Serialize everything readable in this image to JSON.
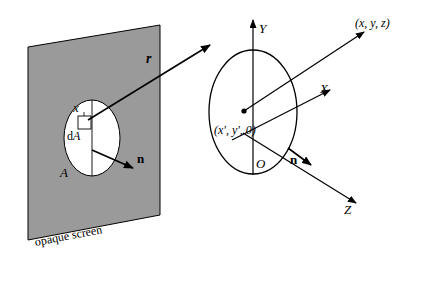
{
  "figure": {
    "colors": {
      "screen_fill": "#9a9a9a",
      "aperture_fill": "#ffffff",
      "stroke": "#000000",
      "background": "#ffffff"
    },
    "left_panel": {
      "screen_label": "opaque screen",
      "aperture_area_label": "A",
      "element_label": "dA",
      "element_coord_label": "x",
      "normal_label": "n",
      "ray_label": "r"
    },
    "right_panel": {
      "axis_y": "Y",
      "axis_x": "X",
      "axis_z": "Z",
      "origin": "O",
      "normal_label": "n",
      "source_point": "(x', y', 0)",
      "field_point": "(x, y, z)"
    }
  }
}
